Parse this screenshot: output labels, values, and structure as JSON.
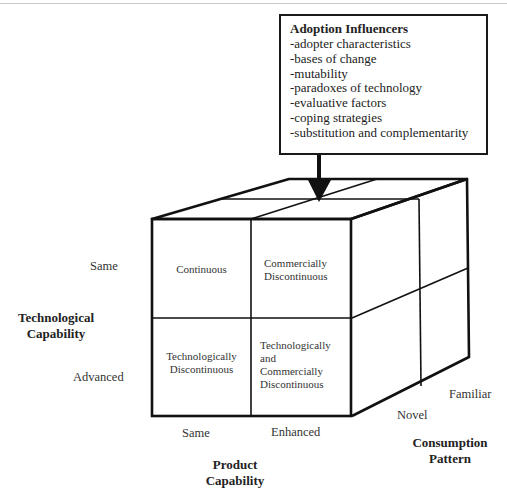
{
  "adoption_influencers": {
    "title": "Adoption Influencers",
    "items": [
      "-adopter characteristics",
      "-bases of change",
      "-mutability",
      "-paradoxes of technology",
      "-evaluative factors",
      "-coping strategies",
      "-substitution and complementarity"
    ]
  },
  "cube": {
    "cells": {
      "same_same": [
        "Continuous"
      ],
      "same_enhanced": [
        "Commercially",
        "Discontinuous"
      ],
      "advanced_same": [
        "Technologically",
        "Discontinuous"
      ],
      "advanced_enhanced": [
        "Technologically",
        "and",
        "Commercially",
        "Discontinuous"
      ]
    }
  },
  "axes": {
    "technological_capability": {
      "title_line1": "Technological",
      "title_line2": "Capability",
      "levels": [
        "Same",
        "Advanced"
      ]
    },
    "product_capability": {
      "title_line1": "Product",
      "title_line2": "Capability",
      "levels": [
        "Same",
        "Enhanced"
      ]
    },
    "consumption_pattern": {
      "title_line1": "Consumption",
      "title_line2": "Pattern",
      "levels": [
        "Novel",
        "Familiar"
      ]
    }
  }
}
